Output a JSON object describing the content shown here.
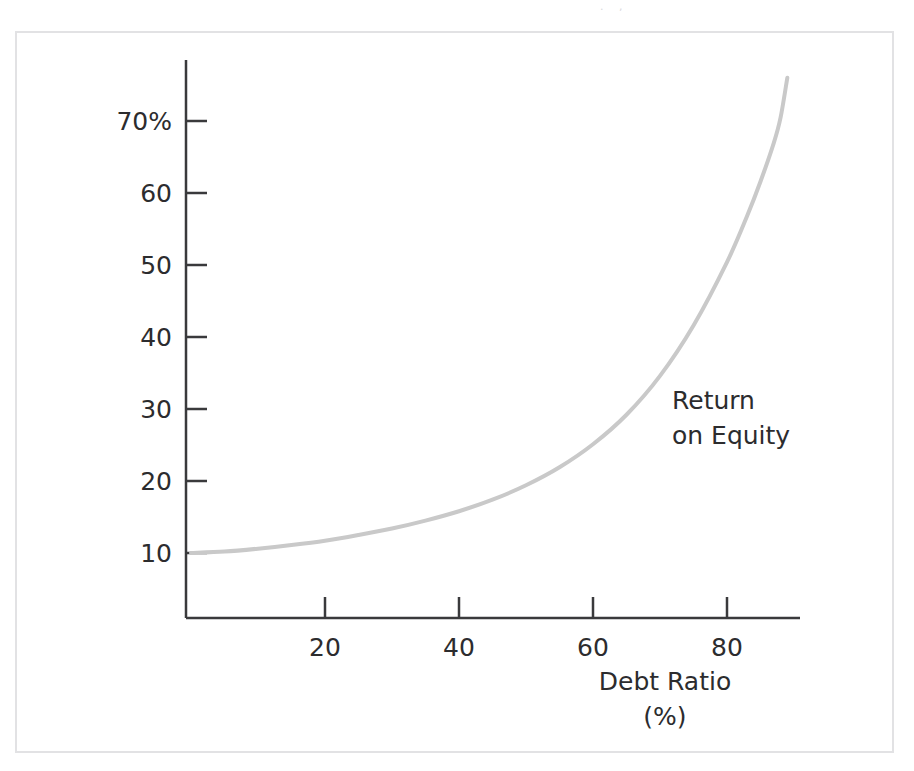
{
  "figure": {
    "background_color": "#ffffff",
    "frame_color": "#e2e2e4",
    "bleed_text": ". ,"
  },
  "chart_data": {
    "type": "line",
    "title": "",
    "subtitle": "",
    "xlabel": "Debt Ratio",
    "xlabel_unit": "(%)",
    "ylabel": "",
    "ylabel_unit": "%",
    "grid": false,
    "legend_position": "inline-annotation",
    "series": [
      {
        "name": "Return on Equity",
        "annotation_line_1": "Return",
        "annotation_line_2": "on Equity",
        "color": "#c9c9c9",
        "line_width": 4,
        "x": [
          0,
          5,
          10,
          15,
          20,
          25,
          30,
          35,
          40,
          45,
          50,
          55,
          60,
          65,
          70,
          75,
          80,
          83,
          85,
          87,
          88,
          89
        ],
        "values": [
          10.0,
          10.2,
          10.6,
          11.1,
          11.7,
          12.5,
          13.4,
          14.5,
          15.8,
          17.4,
          19.4,
          21.9,
          25.1,
          29.2,
          34.6,
          41.6,
          50.4,
          56.8,
          61.6,
          67.0,
          70.5,
          76.0
        ]
      }
    ],
    "xlim": [
      0,
      92
    ],
    "ylim": [
      0,
      78
    ],
    "x_ticks": [
      20,
      40,
      60,
      80
    ],
    "x_tick_labels": [
      "20",
      "40",
      "60",
      "80"
    ],
    "y_ticks": [
      10,
      20,
      30,
      40,
      50,
      60,
      70
    ],
    "y_tick_labels": [
      "10",
      "20",
      "30",
      "40",
      "50",
      "60",
      "70%"
    ],
    "axis_color": "#3a3a3c"
  }
}
